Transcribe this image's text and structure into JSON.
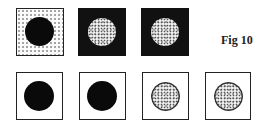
{
  "figure": {
    "label": "Fig 10",
    "rows": [
      {
        "row": "top",
        "panels": [
          {
            "background": "stippled",
            "disc": "solid-black"
          },
          {
            "background": "black",
            "disc": "white-mottled"
          },
          {
            "background": "black",
            "disc": "white-mottled"
          }
        ]
      },
      {
        "row": "bottom",
        "panels": [
          {
            "background": "white",
            "disc": "solid-black"
          },
          {
            "background": "white",
            "disc": "solid-black"
          },
          {
            "background": "white",
            "disc": "mottled-outlined"
          },
          {
            "background": "white",
            "disc": "mottled-outlined"
          }
        ]
      }
    ]
  }
}
